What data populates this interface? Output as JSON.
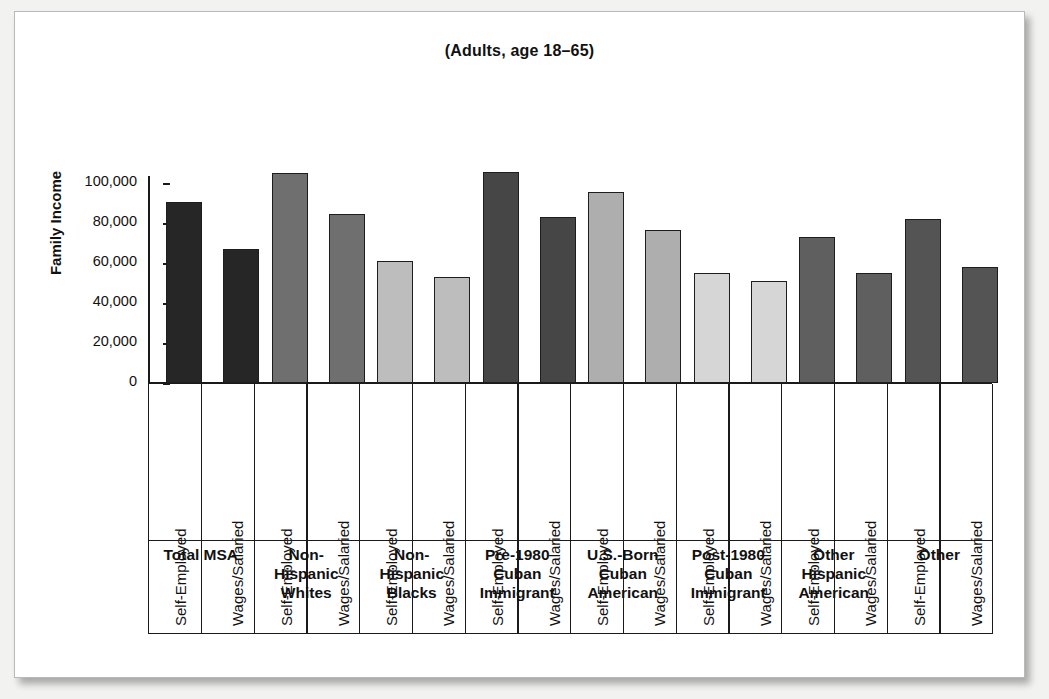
{
  "figure": {
    "title": "(Adults, age 18–65)",
    "ylabel": "Family Income",
    "bar_label_self": "Self-Employed",
    "bar_label_wages": "Wages/Salaried"
  },
  "chart_data": {
    "type": "bar",
    "title": "(Adults, age 18–65)",
    "xlabel": "",
    "ylabel": "Family Income",
    "ylim": [
      0,
      110000
    ],
    "yticks": [
      0,
      20000,
      40000,
      60000,
      80000,
      100000
    ],
    "ytick_labels": [
      "0",
      "20,000",
      "40,000",
      "60,000",
      "80,000",
      "100,000"
    ],
    "grid": false,
    "legend": "none",
    "categories": [
      "Total MSA",
      "Non-Hispanic Whites",
      "Non-Hispanic Blacks",
      "Pre-1980 Cuban Immigrant",
      "U.S.-Born Cuban American",
      "Post-1980 Cuban Immigrant",
      "Other Hispanic American",
      "Other"
    ],
    "series": [
      {
        "name": "Self-Employed",
        "values": [
          90500,
          105000,
          61000,
          105500,
          95500,
          55000,
          73000,
          82000
        ]
      },
      {
        "name": "Wages/Salaried",
        "values": [
          67000,
          84500,
          53000,
          83000,
          76500,
          51000,
          55000,
          58000
        ]
      }
    ],
    "group_colors": [
      "#262626",
      "#6f6f6f",
      "#bdbdbd",
      "#464646",
      "#aeaeae",
      "#d6d6d6",
      "#5f5f5f",
      "#545454"
    ],
    "bar_outline_color": "#1d1d1d"
  },
  "groups": [
    {
      "name_lines": [
        "Total MSA"
      ],
      "label_self": "Self-Employed",
      "label_wages": "Wages/Salaried"
    },
    {
      "name_lines": [
        "Non-",
        "Hispanic",
        "Whites"
      ],
      "label_self": "Self-Employed",
      "label_wages": "Wages/Salaried"
    },
    {
      "name_lines": [
        "Non-",
        "Hispanic",
        "Blacks"
      ],
      "label_self": "Self-Employed",
      "label_wages": "Wages/Salaried"
    },
    {
      "name_lines": [
        "Pre-1980",
        "Cuban",
        "Immigrant"
      ],
      "label_self": "Self-Employed",
      "label_wages": "Wages/Salaried"
    },
    {
      "name_lines": [
        "U.S.-Born",
        "Cuban",
        "American"
      ],
      "label_self": "Self-Employed",
      "label_wages": "Wages/Salaried"
    },
    {
      "name_lines": [
        "Post-1980",
        "Cuban",
        "Immigrant"
      ],
      "label_self": "Self-Employed",
      "label_wages": "Wages/Salaried"
    },
    {
      "name_lines": [
        "Other",
        "Hispanic",
        "American"
      ],
      "label_self": "Self-Employed",
      "label_wages": "Wages/Salaried"
    },
    {
      "name_lines": [
        "Other"
      ],
      "label_self": "Self-Employed",
      "label_wages": "Wages/Salaried"
    }
  ]
}
